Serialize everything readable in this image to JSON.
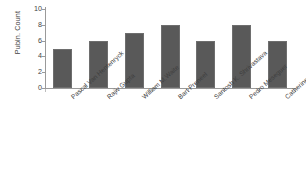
{
  "chart_data": {
    "type": "bar",
    "title": "",
    "subtitle": "",
    "xlabel": "",
    "ylabel": "Publn. Count",
    "categories": [
      "Pascal Van Hentenryck",
      "Rajiv Gupta",
      "William M.Waite",
      "Bart Preneel",
      "Santosh K. Shrivastava",
      "Pedro Meseguer",
      "Catherine C. Marshall"
    ],
    "values": [
      5,
      6,
      7,
      8,
      6,
      8,
      6
    ],
    "ylim": [
      0,
      10
    ],
    "ytick_labels": [
      "0",
      "2",
      "4",
      "6",
      "8",
      "10"
    ],
    "ytick_values": [
      0,
      2,
      4,
      6,
      8,
      10
    ],
    "grid": false,
    "legend": false,
    "legend_position": "none",
    "series_color": "#595959",
    "axis_color": "#9a9a9a",
    "background_color": "#ffffff"
  }
}
